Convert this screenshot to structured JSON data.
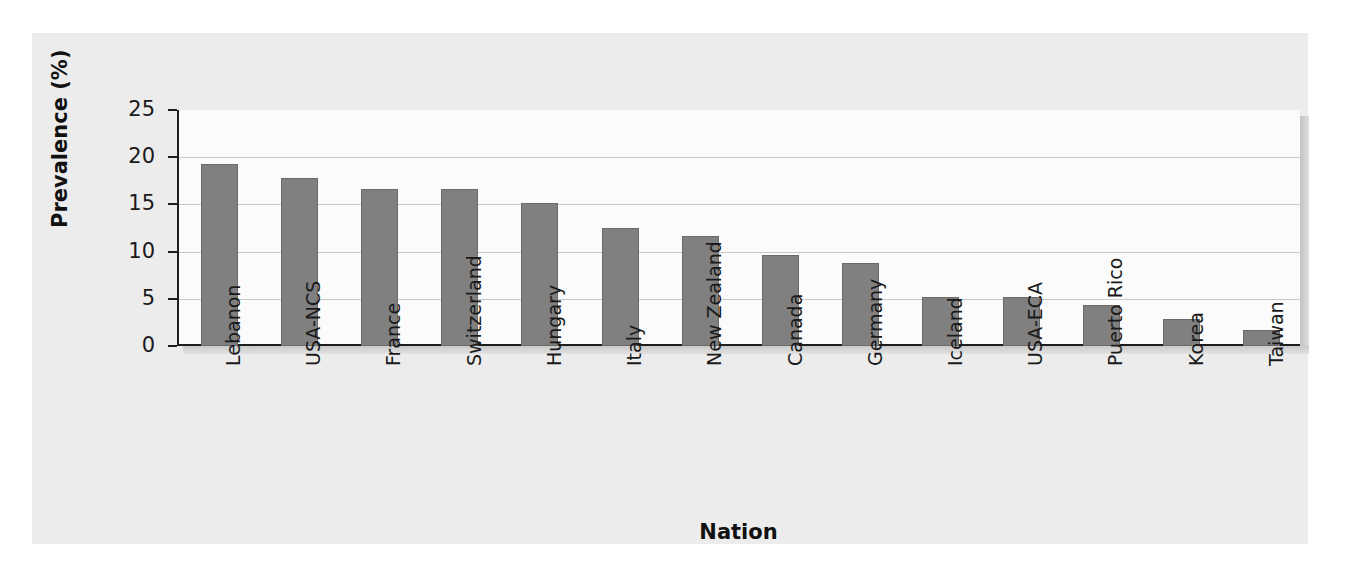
{
  "chart_data": {
    "type": "bar",
    "title": "",
    "xlabel": "Nation",
    "ylabel": "Prevalence (%)",
    "ylim": [
      0,
      25
    ],
    "yticks": [
      0,
      5,
      10,
      15,
      20,
      25
    ],
    "grid": true,
    "legend": null,
    "orientation": "vertical",
    "bar_color": "#808081",
    "categories": [
      "Lebanon",
      "USA-NCS",
      "France",
      "Switzerland",
      "Hungary",
      "Italy",
      "New Zealand",
      "Canada",
      "Germany",
      "Iceland",
      "USA-ECA",
      "Puerto Rico",
      "Korea",
      "Taiwan"
    ],
    "values": [
      19.3,
      17.8,
      16.6,
      16.6,
      15.1,
      12.5,
      11.6,
      9.6,
      8.8,
      5.2,
      5.2,
      4.3,
      2.9,
      1.7
    ]
  },
  "colors": {
    "figure_background": "#ececed",
    "plot_background": "#fbfbfb",
    "axis": "#1d1d1d",
    "gridline": "#c9c9c9",
    "bar_fill": "#808081",
    "bar_border": "#6a6a6b",
    "text": "#1a1a1a"
  }
}
